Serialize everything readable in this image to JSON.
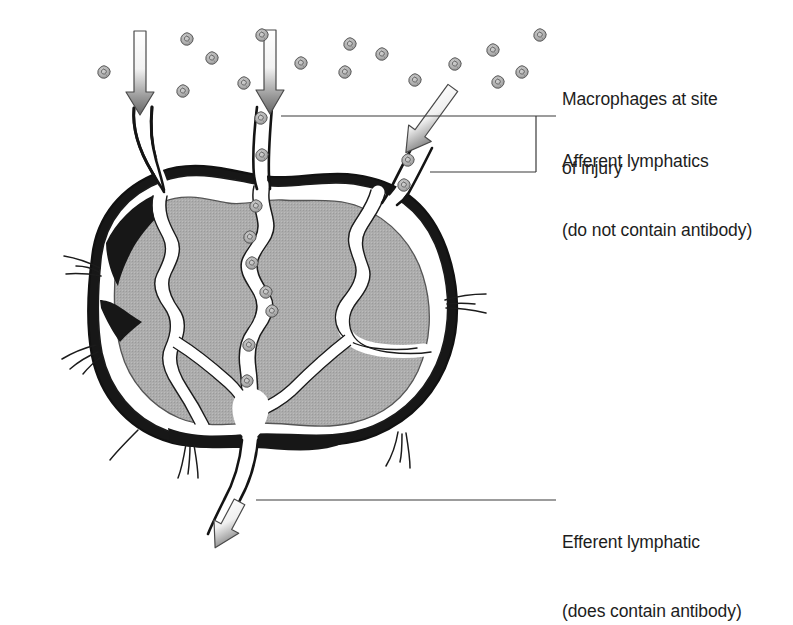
{
  "figure": {
    "background_color": "#ffffff",
    "ink_color": "#1a1a1a",
    "cortex_fill": "#a9a9a9",
    "sinus_fill": "#ffffff",
    "capsule_fill": "#1a1a1a",
    "cell_fill": "#b5b5b5",
    "text_color": "#1d1d1d"
  },
  "labels": {
    "macrophages": {
      "line1": "Macrophages at site",
      "line2": "of injury"
    },
    "afferent": {
      "line1": "Afferent lymphatics",
      "line2": "(do not contain antibody)"
    },
    "efferent": {
      "line1": "Efferent lymphatic",
      "line2": "(does contain antibody)"
    }
  },
  "leaders": {
    "afferent_top_line": "horizontal rule from node toward afferent label",
    "afferent_bracket": "bracket joining two afferent vessels",
    "efferent_line": "horizontal rule from efferent vessel to efferent label"
  },
  "arrows": [
    {
      "name": "afferent-flow-arrow-left",
      "direction": "down",
      "tail": [
        139,
        31
      ],
      "tip": [
        141,
        109
      ]
    },
    {
      "name": "afferent-flow-arrow-center",
      "direction": "down",
      "tail": [
        272,
        30
      ],
      "tip": [
        270,
        108
      ]
    },
    {
      "name": "afferent-flow-arrow-right",
      "direction": "down-left",
      "tail": [
        455,
        88
      ],
      "tip": [
        410,
        155
      ]
    },
    {
      "name": "efferent-flow-arrow",
      "direction": "down-left",
      "tip": [
        215,
        545
      ]
    }
  ],
  "macrophage_field": [
    [
      104,
      72
    ],
    [
      187,
      39
    ],
    [
      212,
      58
    ],
    [
      244,
      83
    ],
    [
      183,
      91
    ],
    [
      262,
      35
    ],
    [
      301,
      63
    ],
    [
      345,
      72
    ],
    [
      382,
      54
    ],
    [
      415,
      80
    ],
    [
      455,
      64
    ],
    [
      493,
      50
    ],
    [
      522,
      72
    ],
    [
      540,
      35
    ],
    [
      498,
      82
    ],
    [
      350,
      44
    ]
  ],
  "sinus_macrophages": [
    [
      261,
      118
    ],
    [
      262,
      155
    ],
    [
      256,
      206
    ],
    [
      250,
      237
    ],
    [
      252,
      263
    ],
    [
      266,
      292
    ],
    [
      272,
      311
    ],
    [
      249,
      345
    ],
    [
      247,
      381
    ],
    [
      408,
      160
    ],
    [
      404,
      185
    ]
  ]
}
